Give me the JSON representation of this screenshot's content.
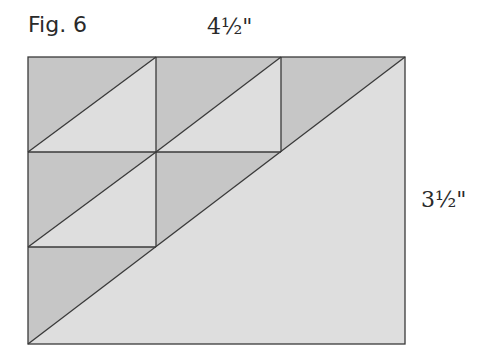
{
  "figure": {
    "title": "Fig. 6",
    "width_label": "4½\"",
    "height_label": "3½\""
  },
  "colors": {
    "dark_fabric": "#c6c6c6",
    "light_fabric": "#dedede",
    "line": "#3a3a3a",
    "background": "#ffffff"
  },
  "diagram": {
    "grid_x": [
      28,
      156,
      281,
      405
    ],
    "grid_y": [
      57,
      152,
      247,
      344
    ],
    "units": [
      {
        "row": 0,
        "col": 0,
        "type": "half-square-triangle"
      },
      {
        "row": 0,
        "col": 1,
        "type": "half-square-triangle"
      },
      {
        "row": 0,
        "col": 2,
        "type": "dark-triangle"
      },
      {
        "row": 1,
        "col": 0,
        "type": "half-square-triangle"
      },
      {
        "row": 1,
        "col": 1,
        "type": "dark-triangle"
      },
      {
        "row": 2,
        "col": 0,
        "type": "dark-triangle"
      }
    ],
    "large_triangle": "light"
  }
}
